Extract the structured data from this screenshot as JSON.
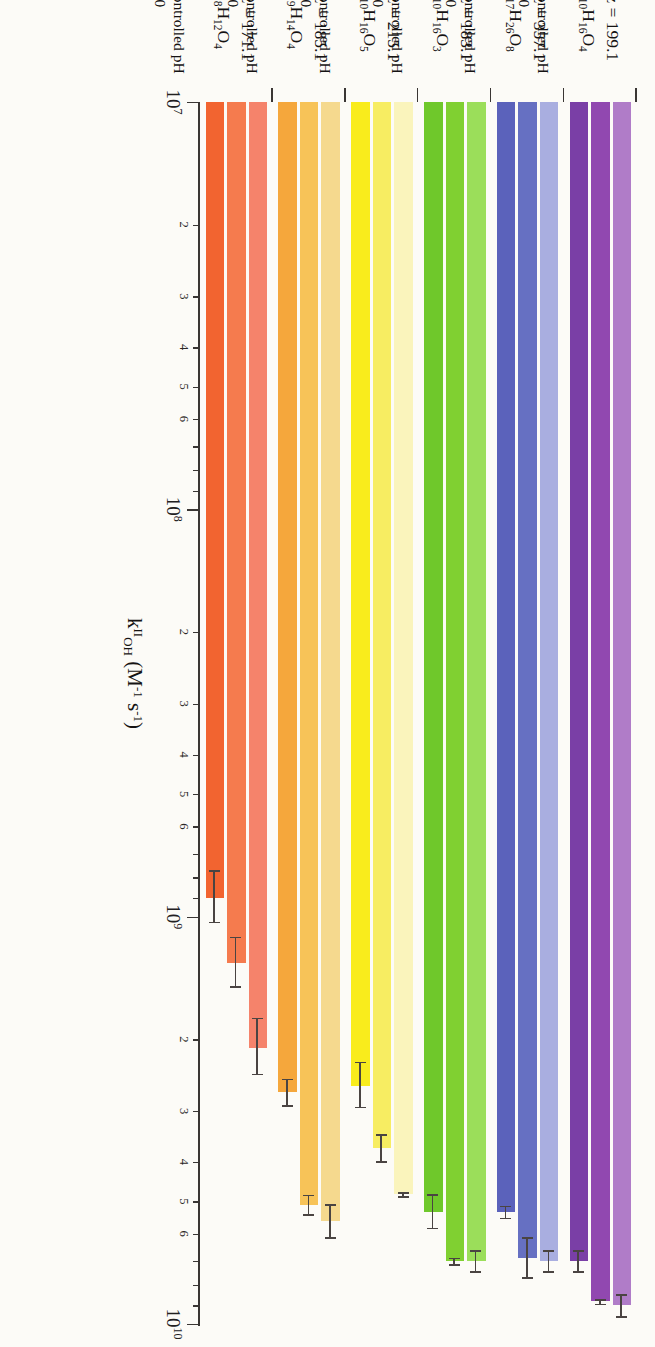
{
  "chart_data": {
    "type": "bar",
    "orientation": "horizontal",
    "title": "",
    "xlabel": "k II OH (M-1 s-1)",
    "ylabel": "",
    "xscale": "log",
    "xlim": [
      10000000,
      10000000000
    ],
    "grid": false,
    "legend_position": "per-group-right",
    "axis_title_parts": {
      "symbol": "k",
      "superscript": "II",
      "subscript": "OH",
      "units": "(M",
      "units_sup1": "-1",
      "units_mid": " s",
      "units_sup2": "-1",
      "units_end": ")"
    },
    "decade_labels": [
      "10",
      "10",
      "10",
      "10"
    ],
    "decade_exponents": [
      "7",
      "8",
      "9",
      "10"
    ],
    "decade_values": [
      10000000,
      100000000,
      1000000000,
      10000000000
    ],
    "minor_tick_labels": [
      "2",
      "3",
      "4",
      "5",
      "6"
    ],
    "series": [
      {
        "name": "pH 2"
      },
      {
        "name": "Uncontrolled pH"
      },
      {
        "name": "pH 10"
      }
    ],
    "groups": [
      {
        "mz_label": "m/z = 171.1",
        "formula_text": "C8H12O4",
        "formula_parts": [
          {
            "t": "C"
          },
          {
            "t": "8",
            "sub": true
          },
          {
            "t": "H"
          },
          {
            "t": "12",
            "sub": true
          },
          {
            "t": "O"
          },
          {
            "t": "4",
            "sub": true
          }
        ],
        "colors": [
          "#F26430",
          "#F57B4E",
          "#F5836B"
        ],
        "values": [
          900000000,
          1300000000,
          2100000000
        ],
        "errors": [
          130000000,
          180000000,
          330000000
        ],
        "legend": [
          "pH 2",
          "Uncontrolled pH",
          "pH 10"
        ]
      },
      {
        "mz_label": "m/z = 185.1",
        "formula_text": "C9H14O4",
        "formula_parts": [
          {
            "t": "C"
          },
          {
            "t": "9",
            "sub": true
          },
          {
            "t": "H"
          },
          {
            "t": "14",
            "sub": true
          },
          {
            "t": "O"
          },
          {
            "t": "4",
            "sub": true
          }
        ],
        "colors": [
          "#F5A73C",
          "#F7C358",
          "#F5D98E"
        ],
        "values": [
          2700000000,
          5100000000,
          5600000000
        ],
        "errors": [
          200000000,
          280000000,
          520000000
        ],
        "legend": [
          "pH 2",
          "Uncontrolled pH",
          "pH 10"
        ]
      },
      {
        "mz_label": "m/z = 215.1",
        "formula_text": "C10H16O5",
        "formula_parts": [
          {
            "t": "C"
          },
          {
            "t": "10",
            "sub": true
          },
          {
            "t": "H"
          },
          {
            "t": "16",
            "sub": true
          },
          {
            "t": "O"
          },
          {
            "t": "5",
            "sub": true
          }
        ],
        "colors": [
          "#F9EC1C",
          "#F7ED62",
          "#FAF4BC"
        ],
        "values": [
          2600000000,
          3700000000,
          4800000000
        ],
        "errors": [
          330000000,
          280000000,
          60000000
        ],
        "legend": [
          "pH 2",
          "Uncontrolled pH",
          "pH 10"
        ]
      },
      {
        "mz_label": "m/z = 183.1",
        "formula_text": "C10H16O3",
        "formula_parts": [
          {
            "t": "C"
          },
          {
            "t": "10",
            "sub": true
          },
          {
            "t": "H"
          },
          {
            "t": "16",
            "sub": true
          },
          {
            "t": "O"
          },
          {
            "t": "3",
            "sub": true
          }
        ],
        "colors": [
          "#6FC82B",
          "#80D031",
          "#9BDE5A"
        ],
        "values": [
          5300000000,
          7000000000,
          7000000000
        ],
        "errors": [
          500000000,
          120000000,
          420000000
        ],
        "legend": [
          "pH 2",
          "Uncontrolled pH",
          "pH 10"
        ]
      },
      {
        "mz_label": "m/z = 357.1",
        "formula_text": "C17H26O8",
        "formula_parts": [
          {
            "t": "C"
          },
          {
            "t": "17",
            "sub": true
          },
          {
            "t": "H"
          },
          {
            "t": "26",
            "sub": true
          },
          {
            "t": "O"
          },
          {
            "t": "8",
            "sub": true
          }
        ],
        "colors": [
          "#5B62BB",
          "#6670C2",
          "#A9AEE0"
        ],
        "values": [
          5300000000,
          6900000000,
          7000000000
        ],
        "errors": [
          180000000,
          780000000,
          420000000
        ],
        "legend": [
          "pH 2",
          "Uncontrolled pH",
          "pH 10"
        ]
      },
      {
        "mz_label": "m/z = 199.1",
        "formula_text": "C10H16O4",
        "formula_parts": [
          {
            "t": "C"
          },
          {
            "t": "10",
            "sub": true
          },
          {
            "t": "H"
          },
          {
            "t": "16",
            "sub": true
          },
          {
            "t": "O"
          },
          {
            "t": "4",
            "sub": true
          }
        ],
        "colors": [
          "#7A3FA6",
          "#9148B0",
          "#B07CC8"
        ],
        "values": [
          7000000000,
          8800000000,
          9000000000
        ],
        "errors": [
          420000000,
          110000000,
          560000000
        ],
        "legend": [
          "pH 2",
          "Uncontrolled pH",
          "pH 10"
        ]
      }
    ]
  }
}
